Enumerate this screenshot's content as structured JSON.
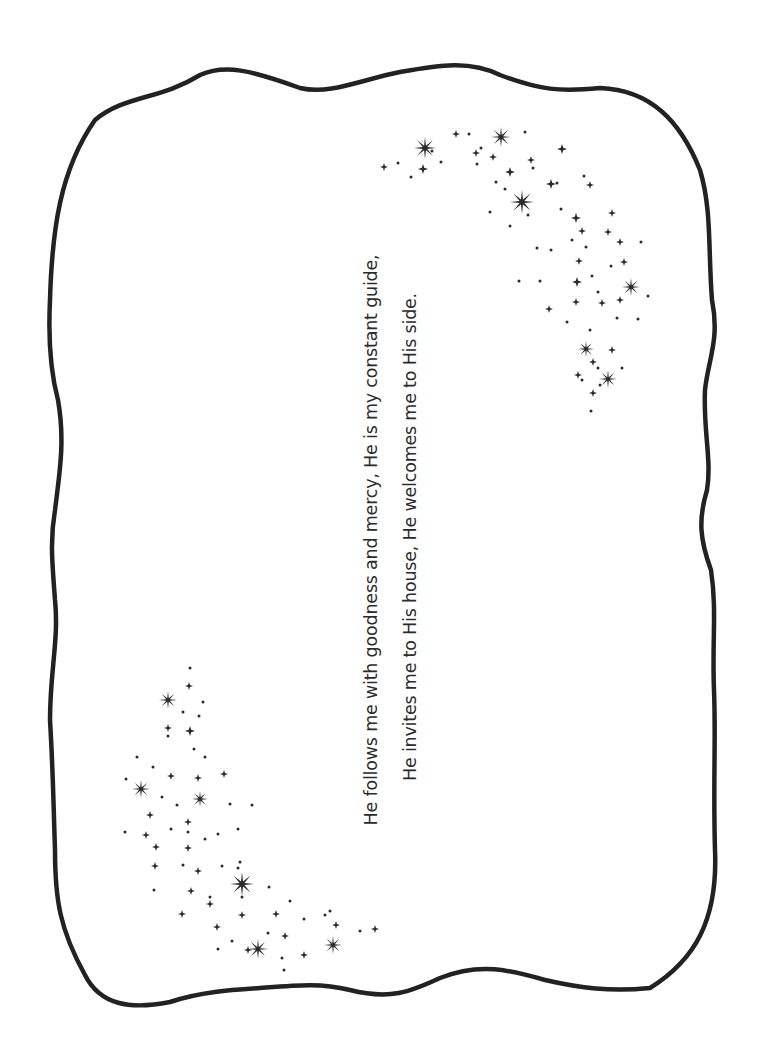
{
  "page": {
    "background": "#ffffff",
    "ink_color": "#2b2b2b",
    "orientation": "rotated-90-ccw"
  },
  "verse": {
    "line1": "He follows me with goodness and mercy, He is my constant guide,",
    "line2": "He invites me to His house, He welcomes me to His side."
  },
  "frame": {
    "shape": "wavy-rounded-rectangle",
    "stroke_color": "#222222",
    "stroke_width": 4.5
  },
  "star_clusters": {
    "top_right": {
      "large": [
        [
          425,
          148,
          11
        ],
        [
          501,
          137,
          10
        ],
        [
          522,
          202,
          12
        ],
        [
          586,
          349,
          8
        ],
        [
          631,
          287,
          9
        ],
        [
          608,
          379,
          9
        ]
      ],
      "medium": [
        [
          384,
          167,
          4
        ],
        [
          456,
          134,
          4
        ],
        [
          476,
          153,
          4
        ],
        [
          493,
          157,
          4
        ],
        [
          531,
          160,
          4
        ],
        [
          423,
          169,
          5
        ],
        [
          562,
          149,
          5
        ],
        [
          551,
          184,
          5
        ],
        [
          510,
          172,
          5
        ],
        [
          576,
          218,
          5
        ],
        [
          582,
          231,
          4
        ],
        [
          590,
          185,
          4
        ],
        [
          612,
          213,
          4
        ],
        [
          608,
          232,
          4
        ],
        [
          620,
          242,
          4
        ],
        [
          624,
          262,
          4
        ],
        [
          579,
          261,
          4
        ],
        [
          577,
          282,
          5
        ],
        [
          620,
          300,
          4
        ],
        [
          576,
          302,
          4
        ],
        [
          549,
          309,
          4
        ],
        [
          602,
          303,
          4
        ],
        [
          612,
          350,
          4
        ],
        [
          593,
          393,
          4
        ],
        [
          578,
          375,
          4
        ],
        [
          593,
          362,
          4
        ]
      ],
      "small": [
        [
          398,
          163,
          1.5
        ],
        [
          411,
          177,
          1.5
        ],
        [
          432,
          151,
          1.5
        ],
        [
          441,
          162,
          1.5
        ],
        [
          469,
          134,
          1.5
        ],
        [
          481,
          148,
          1.5
        ],
        [
          496,
          182,
          1.5
        ],
        [
          505,
          189,
          1.5
        ],
        [
          525,
          132,
          1.5
        ],
        [
          533,
          168,
          1.5
        ],
        [
          557,
          183,
          1.5
        ],
        [
          584,
          176,
          1.5
        ],
        [
          490,
          212,
          1.5
        ],
        [
          510,
          226,
          1.5
        ],
        [
          528,
          215,
          1.5
        ],
        [
          537,
          248,
          1.5
        ],
        [
          551,
          250,
          1.5
        ],
        [
          572,
          240,
          1.5
        ],
        [
          586,
          247,
          1.5
        ],
        [
          592,
          276,
          1.5
        ],
        [
          598,
          292,
          1.5
        ],
        [
          611,
          266,
          1.5
        ],
        [
          641,
          242,
          1.5
        ],
        [
          648,
          296,
          1.5
        ],
        [
          638,
          319,
          1.5
        ],
        [
          617,
          318,
          1.5
        ],
        [
          590,
          330,
          1.5
        ],
        [
          567,
          322,
          1.5
        ],
        [
          519,
          281,
          1.5
        ],
        [
          540,
          281,
          1.5
        ],
        [
          582,
          380,
          1.5
        ],
        [
          598,
          368,
          1.5
        ],
        [
          622,
          368,
          1.5
        ],
        [
          600,
          385,
          1.5
        ],
        [
          591,
          411,
          1.5
        ],
        [
          477,
          164,
          1.5
        ],
        [
          561,
          209,
          1.5
        ]
      ]
    },
    "bottom_left": {
      "large": [
        [
          168,
          700,
          9
        ],
        [
          200,
          799,
          8
        ],
        [
          242,
          884,
          12
        ],
        [
          258,
          949,
          10
        ],
        [
          333,
          945,
          9
        ],
        [
          141,
          789,
          9
        ]
      ],
      "medium": [
        [
          189,
          686,
          4
        ],
        [
          168,
          728,
          4
        ],
        [
          190,
          731,
          5
        ],
        [
          224,
          774,
          4
        ],
        [
          171,
          776,
          4
        ],
        [
          198,
          778,
          4
        ],
        [
          150,
          815,
          4
        ],
        [
          146,
          835,
          4
        ],
        [
          156,
          847,
          4
        ],
        [
          188,
          848,
          4
        ],
        [
          155,
          866,
          4
        ],
        [
          188,
          822,
          4
        ],
        [
          198,
          871,
          4
        ],
        [
          191,
          891,
          4
        ],
        [
          182,
          914,
          4
        ],
        [
          217,
          927,
          4
        ],
        [
          242,
          915,
          4
        ],
        [
          248,
          950,
          4
        ],
        [
          276,
          914,
          4
        ],
        [
          285,
          936,
          4
        ],
        [
          304,
          955,
          4
        ],
        [
          336,
          925,
          4
        ],
        [
          375,
          929,
          4
        ],
        [
          210,
          904,
          4
        ]
      ],
      "small": [
        [
          190,
          668,
          1.5
        ],
        [
          203,
          702,
          1.5
        ],
        [
          183,
          712,
          1.5
        ],
        [
          199,
          716,
          1.5
        ],
        [
          168,
          736,
          1.5
        ],
        [
          194,
          749,
          1.5
        ],
        [
          205,
          757,
          1.5
        ],
        [
          137,
          757,
          1.5
        ],
        [
          153,
          767,
          1.5
        ],
        [
          126,
          779,
          1.5
        ],
        [
          162,
          797,
          1.5
        ],
        [
          177,
          805,
          1.5
        ],
        [
          230,
          804,
          1.5
        ],
        [
          252,
          805,
          1.5
        ],
        [
          171,
          829,
          1.5
        ],
        [
          188,
          832,
          1.5
        ],
        [
          205,
          839,
          1.5
        ],
        [
          218,
          834,
          1.5
        ],
        [
          238,
          829,
          1.5
        ],
        [
          125,
          832,
          1.5
        ],
        [
          183,
          865,
          1.5
        ],
        [
          222,
          866,
          1.5
        ],
        [
          240,
          862,
          1.5
        ],
        [
          238,
          868,
          1.5
        ],
        [
          210,
          897,
          1.5
        ],
        [
          242,
          897,
          1.5
        ],
        [
          269,
          887,
          1.5
        ],
        [
          290,
          901,
          1.5
        ],
        [
          154,
          890,
          1.5
        ],
        [
          268,
          933,
          1.5
        ],
        [
          218,
          949,
          1.5
        ],
        [
          282,
          958,
          1.5
        ],
        [
          304,
          919,
          1.5
        ],
        [
          325,
          915,
          1.5
        ],
        [
          360,
          931,
          1.5
        ],
        [
          330,
          911,
          1.5
        ],
        [
          284,
          970,
          1.5
        ],
        [
          232,
          941,
          1.5
        ]
      ]
    }
  }
}
